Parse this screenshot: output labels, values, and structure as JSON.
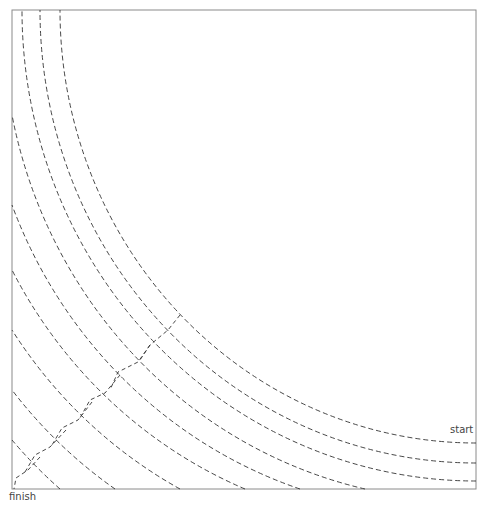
{
  "labels": {
    "start": "start",
    "finish": "finish"
  },
  "colors": {
    "frame": "#8a8a8a",
    "path": "#333333",
    "arrow": "#aaaaaa",
    "background": "#ffffff"
  },
  "frame": {
    "x": 12,
    "y": 10,
    "w": 464,
    "h": 479
  },
  "arc_center": {
    "cx": 476,
    "cy": 10
  },
  "arcs": [
    {
      "from": [
        476,
        481
      ],
      "to": [
        22,
        10
      ]
    },
    {
      "from": [
        476,
        463
      ],
      "to": [
        40,
        10
      ]
    },
    {
      "from": [
        476,
        443
      ],
      "to": [
        60,
        10
      ]
    },
    {
      "from": [
        365,
        489
      ],
      "to": [
        12,
        115
      ]
    },
    {
      "from": [
        300,
        489
      ],
      "to": [
        12,
        205
      ]
    },
    {
      "from": [
        245,
        489
      ],
      "to": [
        12,
        270
      ]
    },
    {
      "from": [
        180,
        489
      ],
      "to": [
        12,
        330
      ]
    },
    {
      "from": [
        115,
        489
      ],
      "to": [
        12,
        390
      ]
    },
    {
      "from": [
        60,
        489
      ],
      "to": [
        12,
        440
      ]
    }
  ],
  "connectors": [
    [
      [
        180,
        315
      ],
      [
        168,
        330
      ],
      [
        150,
        345
      ],
      [
        140,
        360
      ]
    ],
    [
      [
        150,
        345
      ],
      [
        138,
        362
      ],
      [
        118,
        372
      ],
      [
        110,
        390
      ]
    ],
    [
      [
        120,
        375
      ],
      [
        105,
        393
      ],
      [
        90,
        400
      ],
      [
        80,
        418
      ]
    ],
    [
      [
        92,
        402
      ],
      [
        78,
        420
      ],
      [
        62,
        428
      ],
      [
        52,
        445
      ]
    ],
    [
      [
        66,
        430
      ],
      [
        50,
        447
      ],
      [
        35,
        455
      ],
      [
        25,
        472
      ]
    ],
    [
      [
        40,
        457
      ],
      [
        28,
        470
      ],
      [
        16,
        478
      ],
      [
        14,
        489
      ]
    ]
  ]
}
